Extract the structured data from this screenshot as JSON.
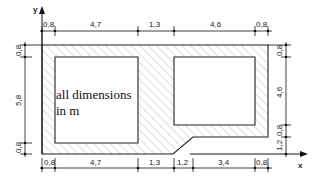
{
  "diagram": {
    "type": "cross-section",
    "axes": {
      "x_label": "x",
      "y_label": "y"
    },
    "note": {
      "line1": "all dimensions",
      "line2": "in m"
    },
    "top_dimensions": [
      "0,8",
      "4,7",
      "1,3",
      "4,6",
      "0,8"
    ],
    "bottom_dimensions": [
      "0,8",
      "4,7",
      "1,3",
      "1,2",
      "3,4",
      "0,8"
    ],
    "left_dimensions": [
      "0,8",
      "5,8",
      "0,8"
    ],
    "right_dimensions": [
      "0,8",
      "4,6",
      "0,8",
      "1,2"
    ]
  }
}
